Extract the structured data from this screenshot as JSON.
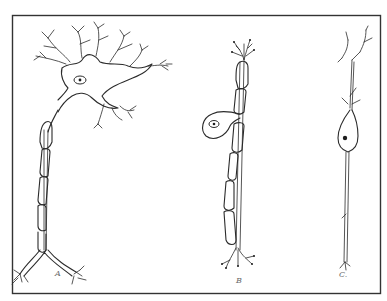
{
  "figure": {
    "panels": [
      {
        "id": "A",
        "label": "A",
        "type": "multipolar neuron"
      },
      {
        "id": "B",
        "label": "B",
        "type": "unipolar (pseudo-unipolar) neuron"
      },
      {
        "id": "C",
        "label": "C.",
        "type": "bipolar neuron"
      }
    ]
  },
  "colors": {
    "background": "#ffffff",
    "ink": "#2b2b2b",
    "frame": "#333333"
  }
}
